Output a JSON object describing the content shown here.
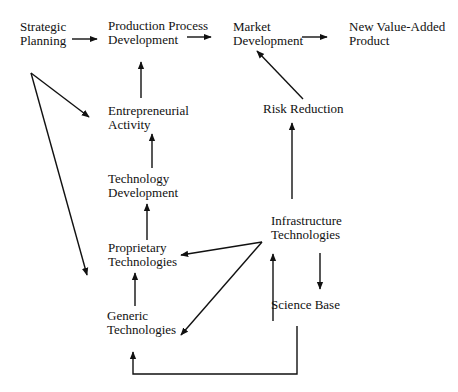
{
  "diagram": {
    "type": "flow",
    "nodes": {
      "strategic_planning": {
        "line1": "Strategic",
        "line2": "Planning"
      },
      "production_process": {
        "line1": "Production Process",
        "line2": "Development"
      },
      "market_development": {
        "line1": "Market",
        "line2": "Development"
      },
      "new_value_added": {
        "line1": "New Value-Added",
        "line2": "Product"
      },
      "entrepreneurial": {
        "line1": "Entrepreneurial",
        "line2": "Activity"
      },
      "technology_development": {
        "line1": "Technology",
        "line2": "Development"
      },
      "proprietary": {
        "line1": "Proprietary",
        "line2": "Technologies"
      },
      "generic": {
        "line1": "Generic",
        "line2": "Technologies"
      },
      "risk_reduction": {
        "line1": "Risk Reduction"
      },
      "infrastructure": {
        "line1": "Infrastructure",
        "line2": "Technologies"
      },
      "science_base": {
        "line1": "Science Base"
      }
    },
    "edges": [
      {
        "from": "Strategic Planning",
        "to": "Production Process Development"
      },
      {
        "from": "Production Process Development",
        "to": "Market Development"
      },
      {
        "from": "Market Development",
        "to": "New Value-Added Product"
      },
      {
        "from": "Strategic Planning",
        "to": "Entrepreneurial Activity"
      },
      {
        "from": "Strategic Planning",
        "to": "Generic Technologies"
      },
      {
        "from": "Entrepreneurial Activity",
        "to": "Production Process Development"
      },
      {
        "from": "Technology Development",
        "to": "Entrepreneurial Activity"
      },
      {
        "from": "Proprietary Technologies",
        "to": "Technology Development"
      },
      {
        "from": "Generic Technologies",
        "to": "Proprietary Technologies"
      },
      {
        "from": "Risk Reduction",
        "to": "Market Development"
      },
      {
        "from": "Infrastructure Technologies",
        "to": "Risk Reduction"
      },
      {
        "from": "Infrastructure Technologies",
        "to": "Proprietary Technologies"
      },
      {
        "from": "Infrastructure Technologies",
        "to": "Generic Technologies"
      },
      {
        "from": "Science Base",
        "to": "Infrastructure Technologies"
      },
      {
        "from": "Infrastructure Technologies",
        "to": "Science Base"
      },
      {
        "from": "Science Base",
        "to": "Generic Technologies"
      }
    ]
  }
}
